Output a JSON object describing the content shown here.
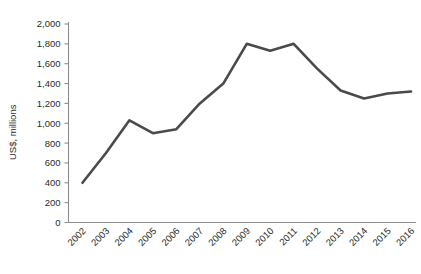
{
  "chart_data": {
    "type": "line",
    "title": "",
    "subtitle": "",
    "xlabel": "",
    "ylabel": "US$, millions",
    "categories": [
      "2002",
      "2003",
      "2004",
      "2005",
      "2006",
      "2007",
      "2008",
      "2009",
      "2010",
      "2011",
      "2012",
      "2013",
      "2014",
      "2015",
      "2016"
    ],
    "x": [
      2002,
      2003,
      2004,
      2005,
      2006,
      2007,
      2008,
      2009,
      2010,
      2011,
      2012,
      2013,
      2014,
      2015,
      2016
    ],
    "series": [
      {
        "name": "US$, millions",
        "color": "#4a4a4a",
        "values": [
          400,
          700,
          1030,
          900,
          940,
          1200,
          1400,
          1800,
          1730,
          1800,
          1550,
          1330,
          1250,
          1300,
          1320
        ]
      }
    ],
    "ylim": [
      0,
      2000
    ],
    "yticks": [
      0,
      200,
      400,
      600,
      800,
      1000,
      1200,
      1400,
      1600,
      1800,
      2000
    ],
    "ytick_labels": [
      "0",
      "200",
      "400",
      "600",
      "800",
      "1,000",
      "1,200",
      "1,400",
      "1,600",
      "1,800",
      "2,000"
    ],
    "grid": false,
    "legend": false,
    "legend_position": "none",
    "x_tick_rotation": 45,
    "annotations": []
  },
  "axes": {
    "y_axis_title": "US$, millions",
    "axis_color": "#8c8c8c",
    "label_color": "#2b2b2b"
  },
  "background": {
    "color": "#ffffff"
  }
}
